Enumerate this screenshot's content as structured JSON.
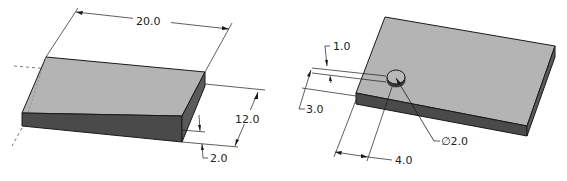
{
  "figure": {
    "left_part": {
      "description": "Rectangular plate, isometric view",
      "dimensions": {
        "length": "20.0",
        "width": "12.0",
        "thickness": "2.0"
      }
    },
    "right_part": {
      "description": "Plate with cylindrical boss, isometric view",
      "dimensions": {
        "boss_height": "1.0",
        "boss_offset_y": "3.0",
        "boss_offset_x": "4.0",
        "boss_diameter": "∅2.0"
      }
    },
    "colors": {
      "top_face": "#b4b4b4",
      "side_face": "#4a4a4a",
      "end_face": "#5a5a5a",
      "line": "#1a1a1a"
    }
  }
}
